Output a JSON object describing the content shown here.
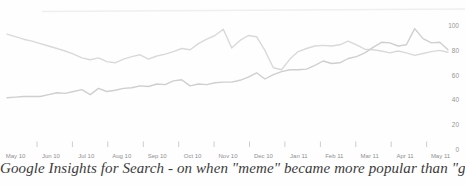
{
  "chart_data": {
    "type": "line",
    "title": "Google Insights for Search - on when \"meme\" became more popular than \"gene\"",
    "x_unit": "week",
    "x_start": "May 2010",
    "x_end": "May 2011",
    "x_tick_labels": [
      "May 10",
      "Jun 10",
      "Jul 10",
      "Aug 10",
      "Sep 10",
      "Oct 10",
      "Nov 10",
      "Dec 10",
      "Jan 11",
      "Feb 11",
      "Mar 11",
      "Apr 11",
      "May 11"
    ],
    "y_tick_labels": [
      "100",
      "80",
      "60",
      "40",
      "20",
      "0"
    ],
    "y_tick_values": [
      100,
      80,
      60,
      40,
      20,
      0
    ],
    "ylim": [
      0,
      110
    ],
    "grid": "off",
    "legend": "none",
    "y_axis_side": "right",
    "series": [
      {
        "name": "gene",
        "color": "#d9d9d9",
        "values": [
          93,
          91,
          89,
          87.5,
          85.5,
          83.5,
          81.5,
          79.5,
          77,
          74,
          72.5,
          74,
          71,
          70,
          73,
          75,
          76.5,
          73,
          75.5,
          77,
          79,
          81.5,
          80.5,
          85.5,
          89,
          92,
          97,
          82,
          88,
          92,
          91,
          80,
          66,
          64.5,
          73,
          79,
          81.5,
          83.5,
          84,
          83.5,
          84.5,
          87.5,
          84.5,
          81,
          80.5,
          79.5,
          78,
          79.5,
          78,
          76,
          77.5,
          79,
          80,
          78.5
        ]
      },
      {
        "name": "meme",
        "color": "#cfcfcf",
        "values": [
          42,
          42.5,
          43,
          43,
          43,
          44.5,
          46,
          45.5,
          47,
          48.5,
          44.5,
          49.5,
          47,
          48,
          49.5,
          50,
          51.5,
          51,
          53,
          52.5,
          55.5,
          56.5,
          51.5,
          53,
          52.5,
          54,
          54.5,
          54.5,
          56,
          58.5,
          62,
          57,
          60.5,
          63,
          64.5,
          64.5,
          65,
          68,
          71.5,
          69.5,
          70,
          73.5,
          75,
          78,
          82.5,
          86.5,
          86,
          83.5,
          84.5,
          97.5,
          89.5,
          86,
          86.5,
          80.5
        ]
      }
    ],
    "annotations": "the 'meme' line crosses above the 'gene' line near Mar 11; 'meme' spikes to ~97 in mid Apr 11; lines nearly touch (~64) in mid Dec 10"
  },
  "colors": {
    "background": "#fefefe",
    "gene_line": "#d9d9d9",
    "meme_line": "#cfcfcf",
    "axis_text": "#8f8f8f",
    "y_axis_text": "#969696",
    "tick": "#b8b8b8",
    "top_rule": "#efefef",
    "caption_text": "#3b3b3b"
  }
}
